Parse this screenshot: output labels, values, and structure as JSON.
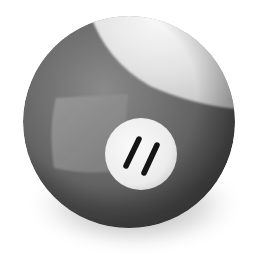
{
  "image": {
    "subject": "Striped billiard ball",
    "ball_number": "11",
    "palette": {
      "background": "#ffffff",
      "stripe": "#6a6a6a",
      "stripe_dark": "#454545",
      "stripe_light": "#8a8a8a",
      "cap": "#e6e6e6",
      "number_disc": "#f1f1f1",
      "number_ink": "#141414",
      "shadow": "#9a9a9a"
    }
  }
}
